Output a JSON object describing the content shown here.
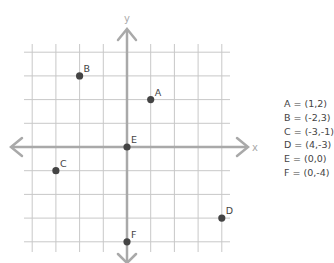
{
  "chart_data": {
    "type": "scatter",
    "title": "",
    "xlabel": "x",
    "ylabel": "y",
    "xlim": [
      -4,
      4
    ],
    "ylim": [
      -4,
      4
    ],
    "grid": true,
    "points": [
      {
        "label": "A",
        "x": 1,
        "y": 2
      },
      {
        "label": "B",
        "x": -2,
        "y": 3
      },
      {
        "label": "C",
        "x": -3,
        "y": -1
      },
      {
        "label": "D",
        "x": 4,
        "y": -3
      },
      {
        "label": "E",
        "x": 0,
        "y": 0
      },
      {
        "label": "F",
        "x": 0,
        "y": -4
      }
    ]
  },
  "axes": {
    "x_label": "x",
    "y_label": "y"
  },
  "legend": [
    "A = (1,2)",
    "B = (-2,3)",
    "C = (-3,-1)",
    "D = (4,-3)",
    "E = (0,0)",
    "F = (0,-4)"
  ],
  "colors": {
    "grid": "#c8c8c8",
    "axis": "#a9a9a9",
    "point": "#444444",
    "text": "#444444"
  }
}
